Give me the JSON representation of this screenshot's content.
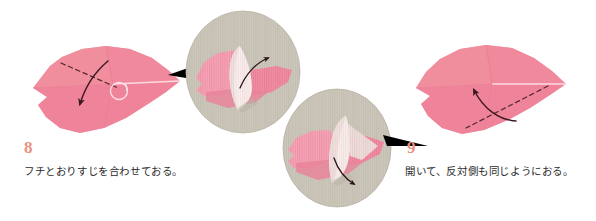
{
  "page": {
    "kind": "origami-instruction-diagram",
    "background_color": "#ffffff",
    "width": 596,
    "height": 221
  },
  "palette": {
    "paper_pink": "#f0869b",
    "paper_pink_light": "#f49db0",
    "paper_pink_shade": "#e8798f",
    "paper_white": "#f7eceb",
    "paper_white_shade": "#e9d9d8",
    "inset_background": "#cdc8bc",
    "inset_background_dark": "#c2bcae",
    "step_number_color": "#e8917f",
    "caption_color": "#2b2b2b",
    "fold_line_color": "#5a2a33",
    "arrow_color": "#3a1a22",
    "pointer_color": "#000000",
    "crease_marker_color": "#ffe2e8"
  },
  "steps": [
    {
      "id": "step-8",
      "number": "8",
      "caption": "フチとおりすじを合わせておる。"
    },
    {
      "id": "step-9",
      "number": "9",
      "caption": "開いて、反対側も同じようにおる。"
    }
  ],
  "figures": {
    "left_leaf": {
      "name": "origami-leaf-step-8",
      "description": "pink leaf-shaped folded paper, notched left edge, dashed fold line from upper-left to center-right, curved arrow folding down-left",
      "fold_line_style": "dashed",
      "arrow_direction": "down-left",
      "crease_marker": true
    },
    "right_leaf": {
      "name": "origami-leaf-step-9",
      "description": "pink leaf-shaped folded paper mirrored, dashed fold line from center-right to lower-left, curved arrow folding up-left",
      "fold_line_style": "dashed",
      "arrow_direction": "up-left",
      "crease_marker": false
    }
  },
  "insets": [
    {
      "id": "inset-1",
      "name": "detail-circle-upper",
      "linked_step": "8",
      "description": "close-up of pink leaf with white paper flap lifted, curved arrow pointing up-right",
      "arrow_direction": "up-right",
      "pointer_side": "left"
    },
    {
      "id": "inset-2",
      "name": "detail-circle-lower",
      "linked_step": "9",
      "description": "close-up of pink leaf with white paper flap standing upright, curved arrow pointing down-right",
      "arrow_direction": "down-right",
      "pointer_side": "right"
    }
  ]
}
